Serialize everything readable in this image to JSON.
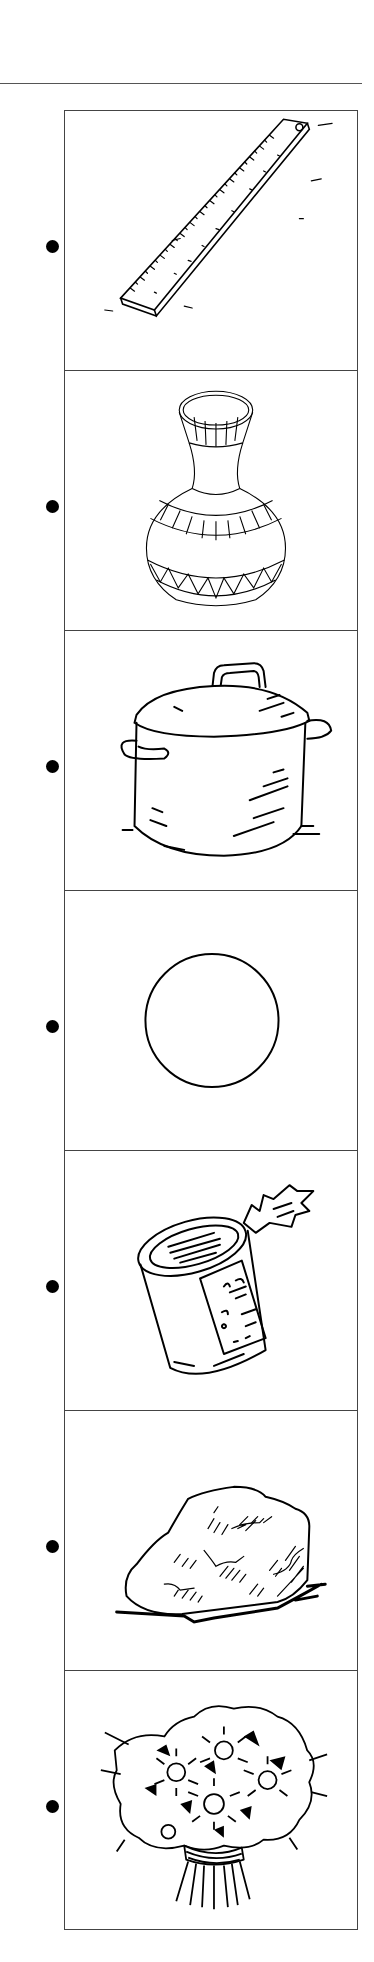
{
  "worksheet": {
    "items": [
      {
        "label": "ruler",
        "icon": "ruler-icon"
      },
      {
        "label": "vase",
        "icon": "vase-icon"
      },
      {
        "label": "pot",
        "icon": "pot-icon"
      },
      {
        "label": "circle",
        "icon": "circle-icon"
      },
      {
        "label": "can",
        "icon": "can-icon"
      },
      {
        "label": "rock",
        "icon": "rock-icon"
      },
      {
        "label": "flowers",
        "icon": "flowers-icon"
      }
    ],
    "colors": {
      "line": "#000000",
      "border": "#444444",
      "background": "#ffffff"
    }
  }
}
